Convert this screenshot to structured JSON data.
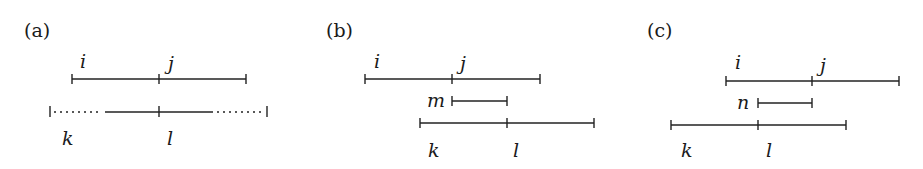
{
  "panels": [
    {
      "id": "a",
      "label": "(a)",
      "labels": {
        "i": "i",
        "j": "j",
        "k": "k",
        "l": "l"
      }
    },
    {
      "id": "b",
      "label": "(b)",
      "labels": {
        "i": "i",
        "j": "j",
        "m": "m",
        "k": "k",
        "l": "l"
      }
    },
    {
      "id": "c",
      "label": "(c)",
      "labels": {
        "i": "i",
        "j": "j",
        "n": "n",
        "k": "k",
        "l": "l"
      }
    }
  ]
}
